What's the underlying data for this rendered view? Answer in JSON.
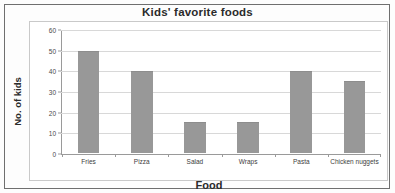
{
  "chart_data": {
    "type": "bar",
    "title": "Kids' favorite foods",
    "xlabel": "Food",
    "ylabel": "No. of kids",
    "categories": [
      "Fries",
      "Pizza",
      "Salad",
      "Wraps",
      "Chicken nuggets"
    ],
    "values": [
      50,
      40,
      15,
      15,
      35
    ],
    "ylim": [
      0,
      60
    ],
    "ytick_labels": [
      "0",
      "10",
      "20",
      "30",
      "40",
      "50",
      "60"
    ],
    "ytick_values": [
      0,
      10,
      20,
      30,
      40,
      50,
      60
    ],
    "grid": "horizontal",
    "legend": "none",
    "bar_color": "#989898",
    "gridline_color": "#d8d8d8",
    "axis_color": "#9a9a9a"
  },
  "bars": [
    {
      "label": "Fries",
      "value": 50
    },
    {
      "label": "Pizza",
      "value": 40
    },
    {
      "label": "Salad",
      "value": 15
    },
    {
      "label": "Wraps",
      "value": 15
    },
    {
      "label": "Pasta",
      "value": 40
    },
    {
      "label": "Chicken nuggets",
      "value": 35
    }
  ],
  "yticks": [
    {
      "label": "60",
      "value": 60
    },
    {
      "label": "50",
      "value": 50
    },
    {
      "label": "40",
      "value": 40
    },
    {
      "label": "30",
      "value": 30
    },
    {
      "label": "20",
      "value": 20
    },
    {
      "label": "10",
      "value": 10
    },
    {
      "label": "0",
      "value": 0
    }
  ]
}
